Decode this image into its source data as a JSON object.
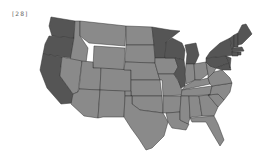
{
  "label": "[28]",
  "colors": {
    "dark": "#555555",
    "medium": "#8a8a8a",
    "border": "#333333"
  },
  "map": {
    "type": "choropleth",
    "region": "United States",
    "states": [
      {
        "id": "WA",
        "shade": "dark",
        "pts": "51,17 75,21 74,38 52,36 49,26"
      },
      {
        "id": "OR",
        "shade": "dark",
        "pts": "49,36 74,38 71,58 43,54 45,44"
      },
      {
        "id": "CA",
        "shade": "dark",
        "pts": "43,54 62,57 60,76 73,94 72,103 61,104 47,88 40,70"
      },
      {
        "id": "ID",
        "shade": "medium",
        "pts": "75,21 80,21 80,36 88,48 86,63 70,61 74,38"
      },
      {
        "id": "NV",
        "shade": "medium",
        "pts": "62,57 82,61 78,92 73,94 60,76"
      },
      {
        "id": "MT",
        "shade": "medium",
        "pts": "80,21 126,26 125,46 89,43 80,36"
      },
      {
        "id": "WY",
        "shade": "medium",
        "pts": "94,46 125,48 124,70 93,68"
      },
      {
        "id": "UT",
        "shade": "medium",
        "pts": "82,61 93,62 93,68 101,68 100,90 79,89"
      },
      {
        "id": "AZ",
        "shade": "medium",
        "pts": "79,89 100,90 98,118 84,116 71,104 73,94 78,92"
      },
      {
        "id": "CO",
        "shade": "medium",
        "pts": "101,68 131,70 131,92 100,90"
      },
      {
        "id": "NM",
        "shade": "medium",
        "pts": "100,90 125,91 124,117 103,117 98,118"
      },
      {
        "id": "ND",
        "shade": "medium",
        "pts": "126,26 152,27 154,45 126,45"
      },
      {
        "id": "SD",
        "shade": "medium",
        "pts": "126,45 154,45 155,63 125,62"
      },
      {
        "id": "NE",
        "shade": "medium",
        "pts": "125,62 155,63 160,80 131,80 131,70 124,70"
      },
      {
        "id": "KS",
        "shade": "medium",
        "pts": "131,80 160,80 162,96 131,96"
      },
      {
        "id": "OK",
        "shade": "medium",
        "pts": "125,91 131,91 131,96 162,96 163,113 140,110 132,104 132,96 125,96"
      },
      {
        "id": "TX",
        "shade": "medium",
        "pts": "125,96 132,96 132,104 140,110 163,113 168,122 164,136 152,148 146,150 139,139 131,128 124,117"
      },
      {
        "id": "MN",
        "shade": "dark",
        "pts": "152,27 170,30 180,31 166,42 165,58 155,58 154,45"
      },
      {
        "id": "IA",
        "shade": "medium",
        "pts": "155,58 175,58 178,67 174,74 158,74 155,63"
      },
      {
        "id": "MO",
        "shade": "medium",
        "pts": "158,74 174,74 180,84 183,95 163,96 162,80 160,80"
      },
      {
        "id": "AR",
        "shade": "medium",
        "pts": "163,96 181,96 180,112 166,113 163,113"
      },
      {
        "id": "LA",
        "shade": "medium",
        "pts": "166,113 180,112 180,120 189,124 186,130 172,128 168,122"
      },
      {
        "id": "WI",
        "shade": "dark",
        "pts": "166,42 172,38 182,43 185,50 184,60 175,58 165,58"
      },
      {
        "id": "IL",
        "shade": "dark",
        "pts": "175,58 184,60 186,74 185,86 181,88 178,80 174,74 178,67"
      },
      {
        "id": "MI",
        "shade": "dark",
        "pts": "185,45 196,43 199,55 195,64 186,64 187,54"
      },
      {
        "id": "IN",
        "shade": "medium",
        "pts": "186,64 194,64 195,80 186,84 185,74"
      },
      {
        "id": "OH",
        "shade": "medium",
        "pts": "194,64 206,62 208,74 200,80 195,80"
      },
      {
        "id": "KY",
        "shade": "medium",
        "pts": "185,86 195,80 200,80 208,78 210,84 182,90"
      },
      {
        "id": "TN",
        "shade": "medium",
        "pts": "182,90 212,86 210,95 181,96"
      },
      {
        "id": "MS",
        "shade": "medium",
        "pts": "181,96 189,96 190,118 188,124 180,120 180,112"
      },
      {
        "id": "AL",
        "shade": "medium",
        "pts": "189,96 199,96 202,116 192,117 190,118"
      },
      {
        "id": "GA",
        "shade": "medium",
        "pts": "199,96 208,95 218,107 214,116 202,116"
      },
      {
        "id": "FL",
        "shade": "medium",
        "pts": "190,118 214,116 218,124 224,140 220,146 214,136 206,122 192,122"
      },
      {
        "id": "SC",
        "shade": "medium",
        "pts": "208,95 218,94 224,100 218,107"
      },
      {
        "id": "NC",
        "shade": "medium",
        "pts": "212,86 232,83 230,92 224,100 218,94 208,95 210,95"
      },
      {
        "id": "VA",
        "shade": "medium",
        "pts": "208,78 214,72 222,70 230,78 232,83 212,86 210,84"
      },
      {
        "id": "WV",
        "shade": "medium",
        "pts": "206,62 210,66 216,68 214,72 208,78 208,74"
      },
      {
        "id": "PA",
        "shade": "dark",
        "pts": "206,58 226,56 229,63 216,68 210,66 206,62"
      },
      {
        "id": "MD",
        "shade": "dark",
        "pts": "216,68 229,63 231,70 222,70"
      },
      {
        "id": "NJ",
        "shade": "dark",
        "pts": "226,56 231,58 230,68 229,63"
      },
      {
        "id": "NY",
        "shade": "dark",
        "pts": "210,52 220,43 230,38 232,52 234,55 226,56 206,58"
      },
      {
        "id": "VT",
        "shade": "dark",
        "pts": "230,38 234,35 234,47 232,50"
      },
      {
        "id": "NH",
        "shade": "dark",
        "pts": "234,35 238,33 238,47 234,47"
      },
      {
        "id": "ME",
        "shade": "dark",
        "pts": "238,33 242,25 246,24 252,34 242,44 238,45"
      },
      {
        "id": "MA",
        "shade": "dark",
        "pts": "232,48 242,47 244,51 232,52"
      },
      {
        "id": "CT",
        "shade": "dark",
        "pts": "232,52 238,52 238,56 232,56"
      },
      {
        "id": "RI",
        "shade": "dark",
        "pts": "238,52 241,52 241,55 238,55"
      }
    ]
  }
}
